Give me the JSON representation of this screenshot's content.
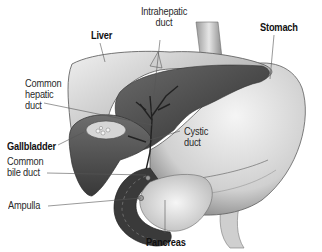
{
  "diagram": {
    "labels": {
      "liver": "Liver",
      "intrahepatic_duct": "Intrahepatic\nduct",
      "stomach": "Stomach",
      "common_hepatic_duct": "Common\nhepatic\nduct",
      "gallbladder": "Gallbladder",
      "cystic_duct": "Cystic\nduct",
      "common_bile_duct": "Common\nbile duct",
      "ampulla": "Ampulla",
      "pancreas": "Pancreas"
    },
    "colors": {
      "liver_light": "#d9d9d9",
      "liver_dark": "#4a4a4a",
      "stomach": "#e2e2e2",
      "duodenum_wall": "#3c3c3c",
      "pancreas": "#ececec",
      "leader_line": "#555555",
      "text": "#222222"
    }
  }
}
